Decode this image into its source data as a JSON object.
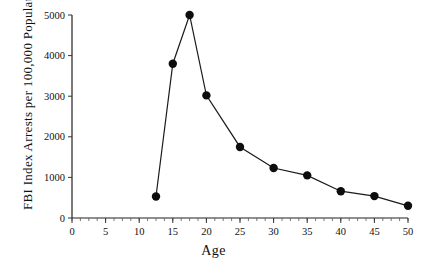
{
  "chart_data": {
    "type": "line",
    "title": "",
    "xlabel": "Age",
    "ylabel": "FBI Index Arrests per 100,000 Population",
    "xlim": [
      0,
      50
    ],
    "ylim": [
      0,
      5000
    ],
    "xticks": [
      0,
      5,
      10,
      15,
      20,
      25,
      30,
      35,
      40,
      45,
      50
    ],
    "xtick_labels": [
      "0",
      "5",
      "10",
      "15",
      "20",
      "25",
      "30",
      "35",
      "40",
      "45",
      "50"
    ],
    "yticks": [
      0,
      1000,
      2000,
      3000,
      4000,
      5000
    ],
    "ytick_labels": [
      "0",
      "1000",
      "2000",
      "3000",
      "4000",
      "5000"
    ],
    "x_minor_tick_step": 1.25,
    "grid": false,
    "legend": false,
    "marker": "filled-circle",
    "series": [
      {
        "name": "FBI Index Arrest Rate",
        "x": [
          12.5,
          15,
          17.5,
          20,
          25,
          30,
          35,
          40,
          45,
          50
        ],
        "values": [
          530,
          3800,
          5000,
          3020,
          1750,
          1230,
          1050,
          660,
          540,
          300
        ]
      }
    ]
  },
  "figure": {
    "background_color": "#ffffff",
    "line_color": "#1a1a1a",
    "marker_color": "#0d0d0d",
    "axis_color": "#222222"
  }
}
